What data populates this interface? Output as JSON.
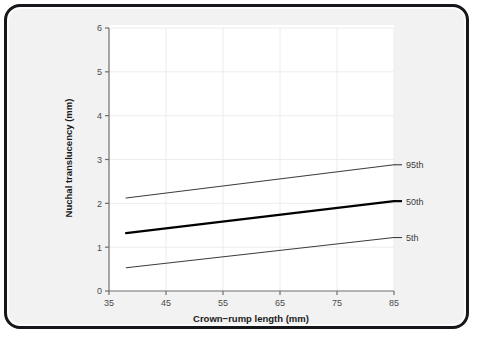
{
  "figure": {
    "background_color": "#f2f2f2",
    "panel_color": "#ffffff",
    "frame_color": "#15171a",
    "grid_color": "#ececec",
    "axis_color": "#6e6e6e"
  },
  "chart_data": {
    "type": "line",
    "title": "",
    "xlabel": "Crown−rump length (mm)",
    "ylabel": "Nuchal translucency (mm)",
    "xlim": [
      35,
      85
    ],
    "ylim": [
      0,
      6
    ],
    "xticks": [
      35,
      45,
      55,
      65,
      75,
      85
    ],
    "yticks": [
      0,
      1,
      2,
      3,
      4,
      5,
      6
    ],
    "xtick_labels": [
      "35",
      "45",
      "55",
      "65",
      "75",
      "85"
    ],
    "ytick_labels": [
      "0",
      "1",
      "2",
      "3",
      "4",
      "5",
      "6"
    ],
    "grid": true,
    "legend_position": "right-inline",
    "series": [
      {
        "name": "95th",
        "label": "95th",
        "color": "#3c3c3c",
        "width": 1.1,
        "x": [
          38,
          85
        ],
        "values": [
          2.12,
          2.88
        ]
      },
      {
        "name": "50th",
        "label": "50th",
        "color": "#000000",
        "width": 2.2,
        "x": [
          38,
          85
        ],
        "values": [
          1.32,
          2.05
        ]
      },
      {
        "name": "5th",
        "label": "5th",
        "color": "#3c3c3c",
        "width": 1.1,
        "x": [
          38,
          85
        ],
        "values": [
          0.53,
          1.22
        ]
      }
    ]
  }
}
